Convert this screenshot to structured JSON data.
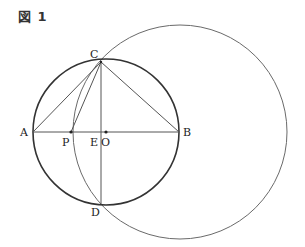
{
  "figure": {
    "title": "図 1"
  },
  "diagram": {
    "type": "geometry",
    "colors": {
      "main_circle": "#333333",
      "secondary_circle": "#666666",
      "lines": "#555555",
      "text": "#222222"
    },
    "points": {
      "A": {
        "label": "A",
        "x": 33,
        "y": 132
      },
      "B": {
        "label": "B",
        "x": 179,
        "y": 132
      },
      "C": {
        "label": "C",
        "x": 101,
        "y": 62
      },
      "D": {
        "label": "D",
        "x": 101,
        "y": 204
      },
      "E": {
        "label": "E",
        "x": 101,
        "y": 132
      },
      "O": {
        "label": "O",
        "x": 106,
        "y": 132
      },
      "P": {
        "label": "P",
        "x": 71,
        "y": 132
      }
    },
    "circles": [
      {
        "name": "circle-O",
        "cx": 106,
        "cy": 132,
        "r": 73
      },
      {
        "name": "circle-large",
        "cx": 180,
        "cy": 132,
        "r": 107
      }
    ],
    "segments": [
      [
        "A",
        "B"
      ],
      [
        "C",
        "A"
      ],
      [
        "C",
        "B"
      ],
      [
        "C",
        "P"
      ],
      [
        "C",
        "D"
      ]
    ]
  }
}
